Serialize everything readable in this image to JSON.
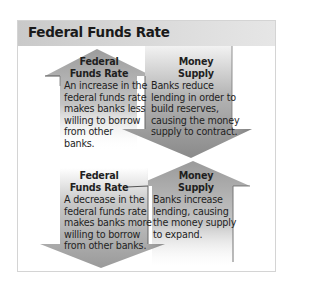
{
  "header": {
    "title": "Federal Funds Rate"
  },
  "colors": {
    "arrow_dark": "#8f8f8f",
    "arrow_light": "#d9d9d9",
    "header_bg": "#d2d2d2",
    "text": "#1f1f1f"
  },
  "panels": [
    {
      "id": "increase",
      "left": {
        "direction": "up",
        "title_line1": "Federal",
        "title_line2": "Funds Rate",
        "body": [
          "An increase in the",
          "federal funds rate",
          "makes banks less",
          "willing to borrow",
          "from other",
          "banks."
        ]
      },
      "right": {
        "direction": "down",
        "title_line1": "Money",
        "title_line2": "Supply",
        "body": [
          "Banks reduce",
          "lending in order to",
          "build reserves,",
          "causing the money",
          "supply to contract."
        ]
      }
    },
    {
      "id": "decrease",
      "left": {
        "direction": "down",
        "title_line1": "Federal",
        "title_line2": "Funds Rate",
        "body": [
          "A decrease in the",
          "federal funds rate",
          "makes banks more",
          "willing to borrow",
          "from other banks."
        ]
      },
      "right": {
        "direction": "up",
        "title_line1": "Money",
        "title_line2": "Supply",
        "body": [
          "Banks increase",
          "lending, causing",
          "the money supply",
          "to expand."
        ]
      }
    }
  ]
}
